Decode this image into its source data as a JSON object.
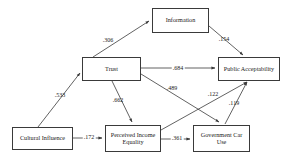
{
  "diagram": {
    "type": "path-model",
    "title": "",
    "nodes": [
      {
        "id": "information",
        "label": "Information",
        "x": 152,
        "y": 8,
        "w": 57,
        "h": 25,
        "font_size": 6.2
      },
      {
        "id": "trust",
        "label": "Trust",
        "x": 82,
        "y": 57,
        "w": 59,
        "h": 24,
        "font_size": 6.2
      },
      {
        "id": "public_acceptability",
        "label": "Public Acceptability",
        "x": 218,
        "y": 57,
        "w": 62,
        "h": 24,
        "font_size": 6.2
      },
      {
        "id": "cultural_influence",
        "label": "Cultural Influence",
        "x": 12,
        "y": 127,
        "w": 61,
        "h": 23,
        "font_size": 6.2
      },
      {
        "id": "perceived_income_equality",
        "label": "Perceived Income\nEquality",
        "x": 105,
        "y": 125,
        "w": 56,
        "h": 27,
        "font_size": 6.2
      },
      {
        "id": "government_car_use",
        "label": "Government Car\nUse",
        "x": 193,
        "y": 125,
        "w": 57,
        "h": 27,
        "font_size": 6.2
      }
    ],
    "edges": [
      {
        "id": "trust-to-information",
        "from": "trust",
        "to": "information",
        "coefficient": ".306",
        "label_x": 108,
        "label_y": 40
      },
      {
        "id": "information-to-public-acceptability",
        "from": "information",
        "to": "public_acceptability",
        "coefficient": ".154",
        "label_x": 224,
        "label_y": 39
      },
      {
        "id": "trust-to-public-acceptability",
        "from": "trust",
        "to": "public_acceptability",
        "coefficient": ".684",
        "label_x": 178,
        "label_y": 68
      },
      {
        "id": "cultural-influence-to-trust",
        "from": "cultural_influence",
        "to": "trust",
        "coefficient": ".533",
        "label_x": 60,
        "label_y": 95
      },
      {
        "id": "trust-to-perceived-income-equality",
        "from": "trust",
        "to": "perceived_income_equality",
        "coefficient": ".662",
        "label_x": 118,
        "label_y": 100
      },
      {
        "id": "trust-to-government-car-use",
        "from": "trust",
        "to": "government_car_use",
        "coefficient": ".489",
        "label_x": 172,
        "label_y": 88
      },
      {
        "id": "perceived-income-equality-to-public-acceptability",
        "from": "perceived_income_equality",
        "to": "public_acceptability",
        "coefficient": ".122",
        "label_x": 213,
        "label_y": 94
      },
      {
        "id": "government-car-use-to-public-acceptability",
        "from": "government_car_use",
        "to": "public_acceptability",
        "coefficient": ".119",
        "label_x": 234,
        "label_y": 103
      },
      {
        "id": "cultural-influence-to-perceived-income-equality",
        "from": "cultural_influence",
        "to": "perceived_income_equality",
        "coefficient": ".172",
        "label_x": 89,
        "label_y": 137
      },
      {
        "id": "perceived-income-equality-to-government-car-use",
        "from": "perceived_income_equality",
        "to": "government_car_use",
        "coefficient": ".361",
        "label_x": 177,
        "label_y": 138
      }
    ],
    "colors": {
      "stroke": "#3a3a3a",
      "text": "#1a1a1a",
      "background": "#ffffff"
    }
  }
}
